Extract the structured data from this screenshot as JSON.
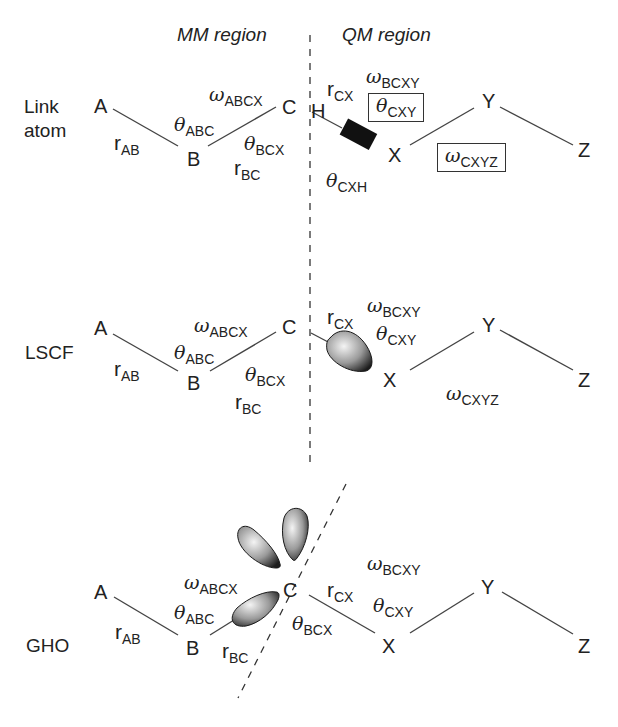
{
  "regions": {
    "mm": "MM region",
    "qm": "QM region"
  },
  "panels": [
    {
      "name": "Link atom",
      "label_lines": [
        "Link",
        "atom"
      ],
      "atoms": {
        "A": "A",
        "B": "B",
        "C": "C",
        "H": "H",
        "X": "X",
        "Y": "Y",
        "Z": "Z"
      },
      "labels": {
        "r_AB": {
          "sym": "r",
          "sub": "AB"
        },
        "theta_ABC": {
          "sym": "θ",
          "sub": "ABC"
        },
        "omega_ABCX": {
          "sym": "ω",
          "sub": "ABCX"
        },
        "theta_BCX": {
          "sym": "θ",
          "sub": "BCX"
        },
        "r_BC": {
          "sym": "r",
          "sub": "BC"
        },
        "r_CX": {
          "sym": "r",
          "sub": "CX"
        },
        "omega_BCXY": {
          "sym": "ω",
          "sub": "BCXY"
        },
        "theta_CXY": {
          "sym": "θ",
          "sub": "CXY",
          "boxed": true
        },
        "omega_CXYZ": {
          "sym": "ω",
          "sub": "CXYZ",
          "boxed": true
        },
        "theta_CXH": {
          "sym": "θ",
          "sub": "CXH"
        }
      },
      "boundary": "vertical dashed line",
      "special": "black link-bond block between H and X"
    },
    {
      "name": "LSCF",
      "label_lines": [
        "LSCF"
      ],
      "atoms": {
        "A": "A",
        "B": "B",
        "C": "C",
        "X": "X",
        "Y": "Y",
        "Z": "Z"
      },
      "labels": {
        "r_AB": {
          "sym": "r",
          "sub": "AB"
        },
        "theta_ABC": {
          "sym": "θ",
          "sub": "ABC"
        },
        "omega_ABCX": {
          "sym": "ω",
          "sub": "ABCX"
        },
        "theta_BCX": {
          "sym": "θ",
          "sub": "BCX"
        },
        "r_BC": {
          "sym": "r",
          "sub": "BC"
        },
        "r_CX": {
          "sym": "r",
          "sub": "CX"
        },
        "omega_BCXY": {
          "sym": "ω",
          "sub": "BCXY"
        },
        "theta_CXY": {
          "sym": "θ",
          "sub": "CXY"
        },
        "omega_CXYZ": {
          "sym": "ω",
          "sub": "CXYZ"
        }
      },
      "boundary": "vertical dashed line",
      "special": "frozen localized orbital lobe on C pointing toward X"
    },
    {
      "name": "GHO",
      "label_lines": [
        "GHO"
      ],
      "atoms": {
        "A": "A",
        "B": "B",
        "C": "C",
        "X": "X",
        "Y": "Y",
        "Z": "Z"
      },
      "labels": {
        "r_AB": {
          "sym": "r",
          "sub": "AB"
        },
        "theta_ABC": {
          "sym": "θ",
          "sub": "ABC"
        },
        "omega_ABCX": {
          "sym": "ω",
          "sub": "ABCX"
        },
        "r_BC": {
          "sym": "r",
          "sub": "BC"
        },
        "theta_BCX": {
          "sym": "θ",
          "sub": "BCX"
        },
        "r_CX": {
          "sym": "r",
          "sub": "CX"
        },
        "omega_BCXY": {
          "sym": "ω",
          "sub": "BCXY"
        },
        "theta_CXY": {
          "sym": "θ",
          "sub": "CXY"
        }
      },
      "boundary": "diagonal dashed line through C",
      "special": "three hybrid orbital lobes on boundary atom C"
    }
  ],
  "colors": {
    "line": "#444444",
    "text": "#222222",
    "lobe_dark": "#1a1a1a",
    "lobe_light": "#f0f0f0",
    "link_block": "#111111"
  }
}
